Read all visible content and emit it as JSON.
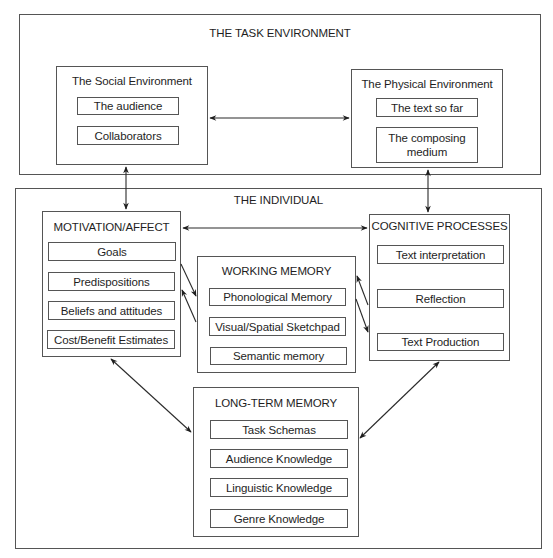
{
  "task_environment": {
    "title": "THE TASK ENVIRONMENT",
    "social_environment": {
      "title": "The Social Environment",
      "items": [
        "The audience",
        "Collaborators"
      ]
    },
    "physical_environment": {
      "title": "The Physical Environment",
      "items": [
        "The text so far",
        "The composing medium"
      ]
    }
  },
  "individual": {
    "title": "THE INDIVIDUAL",
    "motivation_affect": {
      "title": "MOTIVATION/AFFECT",
      "items": [
        "Goals",
        "Predispositions",
        "Beliefs and attitudes",
        "Cost/Benefit Estimates"
      ]
    },
    "working_memory": {
      "title": "WORKING MEMORY",
      "items": [
        "Phonological Memory",
        "Visual/Spatial Sketchpad",
        "Semantic memory"
      ]
    },
    "cognitive_processes": {
      "title": "COGNITIVE PROCESSES",
      "items": [
        "Text interpretation",
        "Reflection",
        "Text Production"
      ]
    },
    "long_term_memory": {
      "title": "LONG-TERM MEMORY",
      "items": [
        "Task Schemas",
        "Audience Knowledge",
        "Linguistic Knowledge",
        "Genre Knowledge"
      ]
    }
  },
  "connections": [
    {
      "from": "The Social Environment",
      "to": "The Physical Environment",
      "type": "bidirectional"
    },
    {
      "from": "The Social Environment",
      "to": "MOTIVATION/AFFECT",
      "type": "bidirectional"
    },
    {
      "from": "The Physical Environment",
      "to": "COGNITIVE PROCESSES",
      "type": "bidirectional"
    },
    {
      "from": "MOTIVATION/AFFECT",
      "to": "COGNITIVE PROCESSES",
      "type": "bidirectional"
    },
    {
      "from": "MOTIVATION/AFFECT",
      "to": "WORKING MEMORY",
      "type": "directed"
    },
    {
      "from": "WORKING MEMORY",
      "to": "MOTIVATION/AFFECT",
      "type": "directed"
    },
    {
      "from": "COGNITIVE PROCESSES",
      "to": "WORKING MEMORY",
      "type": "directed"
    },
    {
      "from": "WORKING MEMORY",
      "to": "COGNITIVE PROCESSES",
      "type": "directed"
    },
    {
      "from": "MOTIVATION/AFFECT",
      "to": "LONG-TERM MEMORY",
      "type": "bidirectional"
    },
    {
      "from": "COGNITIVE PROCESSES",
      "to": "LONG-TERM MEMORY",
      "type": "bidirectional"
    }
  ],
  "colors": {
    "line": "#555555",
    "arrow": "#1e1e1e",
    "text": "#1e1e1e",
    "background": "#ffffff"
  }
}
